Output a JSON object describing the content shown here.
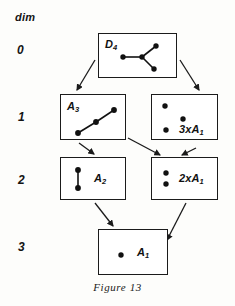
{
  "figure": {
    "caption": "Figure 13",
    "axis_title": "dim",
    "dim_levels": [
      "0",
      "1",
      "2",
      "3"
    ],
    "stroke_color": "#1b1b1b",
    "node_color": "#111111",
    "background": "#fdfdfb"
  },
  "nodes": [
    {
      "id": "d4",
      "label_main": "D",
      "label_sub": "4",
      "dim": "0",
      "diagram_type": "dynkin",
      "dots": 4,
      "edges": 3
    },
    {
      "id": "a3",
      "label_main": "A",
      "label_sub": "3",
      "dim": "1",
      "diagram_type": "dynkin",
      "dots": 3,
      "edges": 2
    },
    {
      "id": "3a1",
      "label_main": "3xA",
      "label_sub": "1",
      "dim": "1",
      "diagram_type": "dynkin",
      "dots": 3,
      "edges": 0
    },
    {
      "id": "a2",
      "label_main": "A",
      "label_sub": "2",
      "dim": "2",
      "diagram_type": "dynkin",
      "dots": 2,
      "edges": 1
    },
    {
      "id": "2a1",
      "label_main": "2xA",
      "label_sub": "1",
      "dim": "2",
      "diagram_type": "dynkin",
      "dots": 2,
      "edges": 0
    },
    {
      "id": "a1",
      "label_main": "A",
      "label_sub": "1",
      "dim": "3",
      "diagram_type": "dynkin",
      "dots": 1,
      "edges": 0
    }
  ],
  "arrows": [
    {
      "from": "d4",
      "to": "a3"
    },
    {
      "from": "d4",
      "to": "3a1"
    },
    {
      "from": "a3",
      "to": "a2"
    },
    {
      "from": "a3",
      "to": "2a1"
    },
    {
      "from": "3a1",
      "to": "2a1"
    },
    {
      "from": "a2",
      "to": "a1"
    },
    {
      "from": "2a1",
      "to": "a1"
    }
  ]
}
